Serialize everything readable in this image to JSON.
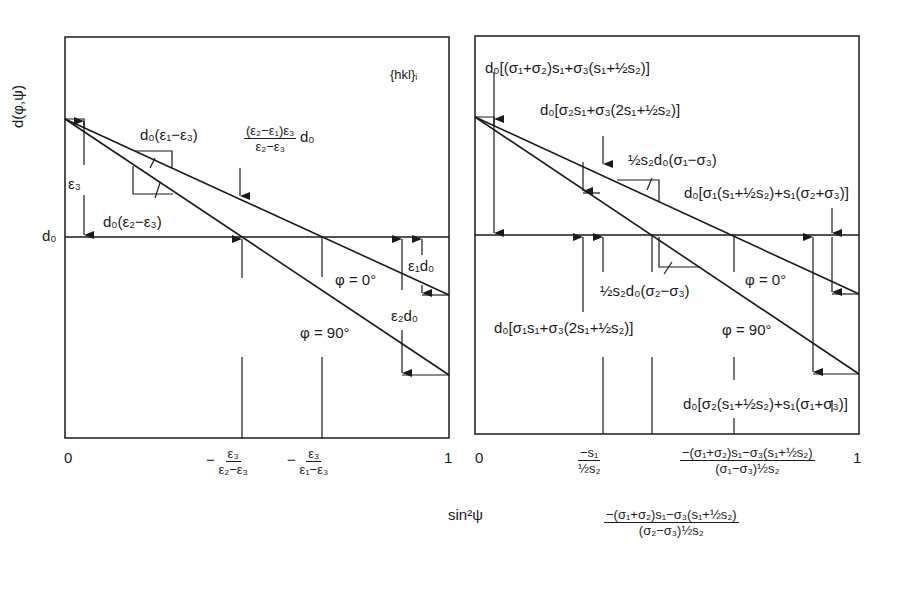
{
  "figure": {
    "left_panel": {
      "y_axis_label": "d(φ,ψ)",
      "d0_label": "d₀",
      "hkl_label": "{hkl}ᵢ",
      "x_tick_0": "0",
      "x_tick_1": "1",
      "slope_phi0": "d₀(ε₁−ε₃)",
      "slope_phi90": "d₀(ε₂−ε₃)",
      "eps3": "ε₃",
      "gap_num": "(ε₂−ε₁)ε₃",
      "gap_den": "ε₂−ε₃",
      "gap_suffix": "d₀",
      "eps1d0": "ε₁d₀",
      "eps2d0": "ε₂d₀",
      "phi0": "φ = 0°",
      "phi90": "φ = 90°",
      "tick_a_num": "ε₃",
      "tick_a_den": "ε₂−ε₃",
      "tick_b_num": "ε₃",
      "tick_b_den": "ε₁−ε₃",
      "minus": "−"
    },
    "right_panel": {
      "x_tick_0": "0",
      "x_tick_1": "1",
      "intercept_top": "d₀[(σ₁+σ₂)s₁+σ₃(s₁+½s₂)]",
      "intercept_90": "d₀[σ₂s₁+σ₃(2s₁+½s₂)]",
      "slope_phi0": "½s₂d₀(σ₁−σ₃)",
      "end_phi0": "d₀[σ₁(s₁+½s₂)+s₁(σ₂+σ₃)]",
      "slope_phi90": "½s₂d₀(σ₂−σ₃)",
      "zero_label": "d₀[σ₁s₁+σ₃(2s₁+½s₂)]",
      "end_phi90": "d₀[σ₂(s₁+½s₂)+s₁(σ₁+σ₃)]",
      "phi0": "φ = 0°",
      "phi90": "φ = 90°",
      "tick_a_num": "−s₁",
      "tick_a_den": "½s₂",
      "tick_c_num": "−(σ₁+σ₂)s₁−σ₃(s₁+½s₂)",
      "tick_c_den": "(σ₁−σ₃)½s₂",
      "tick_b_num": "−(σ₁+σ₂)s₁−σ₃(s₁+½s₂)",
      "tick_b_den": "(σ₂−σ₃)½s₂"
    },
    "x_axis_label": "sin²ψ"
  }
}
